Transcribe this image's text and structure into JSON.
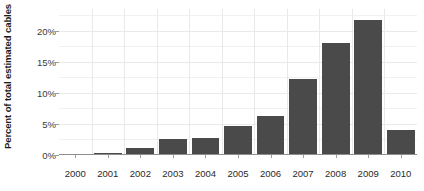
{
  "chart_data": {
    "type": "bar",
    "title": "",
    "xlabel": "",
    "ylabel": "Percent of total estimated cables",
    "categories": [
      "2000",
      "2001",
      "2002",
      "2003",
      "2004",
      "2005",
      "2006",
      "2007",
      "2008",
      "2009",
      "2010"
    ],
    "values": [
      0.2,
      0.3,
      1.1,
      2.5,
      2.8,
      4.7,
      6.3,
      12.2,
      18.0,
      21.7,
      4.0
    ],
    "ylim": [
      0,
      23.5
    ],
    "y_ticks": [
      0,
      5,
      10,
      15,
      20
    ],
    "y_tick_labels": [
      "0%",
      "5%",
      "10%",
      "15%",
      "20%"
    ],
    "y_minor_ticks": [
      2.5,
      7.5,
      12.5,
      17.5,
      22.5
    ],
    "grid": true,
    "grid_axis": "both",
    "legend": "none",
    "bar_color": "#4a4a4a",
    "grid_color": "#e9e9e9",
    "axis_color": "#8e8e8e",
    "value_suffix": "%"
  },
  "axis": {
    "y_title": "Percent of total estimated cables"
  }
}
